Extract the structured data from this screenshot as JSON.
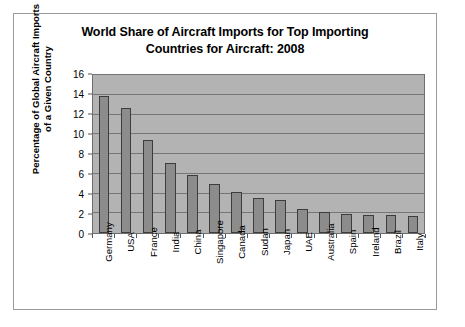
{
  "chart_data": {
    "type": "bar",
    "title": "World Share of Aircraft Imports for Top Importing Countries for Aircraft: 2008",
    "title_lines": [
      "World Share of Aircraft Imports for Top Importing",
      "Countries for Aircraft: 2008"
    ],
    "xlabel": "",
    "ylabel": "Percentage of Global Aircraft Imports of a Given Country",
    "ylabel_lines": [
      "Percentage of Global Aircraft Imports",
      "of a Given Country"
    ],
    "categories": [
      "Germany",
      "USA",
      "France",
      "India",
      "China",
      "Singapore",
      "Canada",
      "Sudan",
      "Japan",
      "UAE",
      "Australia",
      "Spain",
      "Ireland",
      "Brazil",
      "Italy"
    ],
    "values": [
      13.9,
      12.7,
      9.4,
      7.1,
      5.9,
      5.0,
      4.2,
      3.5,
      3.3,
      2.4,
      2.1,
      1.95,
      1.85,
      1.8,
      1.7
    ],
    "ylim": [
      0,
      16
    ],
    "yticks": [
      0,
      2,
      4,
      6,
      8,
      10,
      12,
      14,
      16
    ],
    "grid": true,
    "legend": "none",
    "colors": {
      "bar_fill": "#8c8c8c",
      "bar_border": "#3d3d3d",
      "plot_background": "#b3b3b3",
      "gridline": "#767676",
      "axis": "#555555",
      "text": "#000000",
      "page_background": "#ffffff",
      "frame_border": "#9a9a9a"
    }
  }
}
